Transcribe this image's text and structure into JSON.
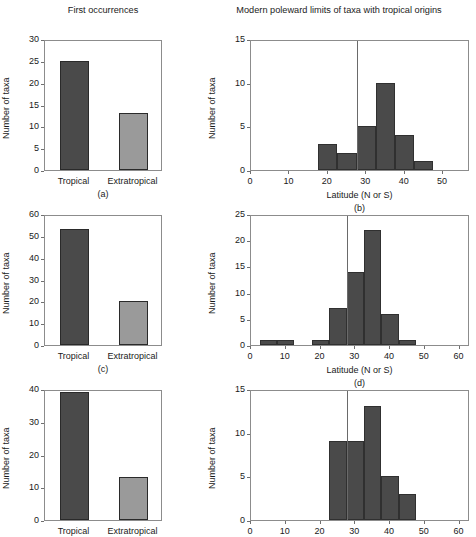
{
  "titles": {
    "left": "First occurrences",
    "right": "Modern poleward limits of taxa with tropical origins"
  },
  "axis_labels": {
    "y": "Number of taxa",
    "x_latitude": "Latitude (N or S)"
  },
  "region_labels": {
    "tropics": "Tropics",
    "extratropics": "Extratropics"
  },
  "categories": {
    "tropical": "Tropical",
    "extratropical": "Extratropical"
  },
  "colors": {
    "bar_dark": "#4a4a4a",
    "bar_light": "#9a9a9a",
    "axis": "#8c8c8c",
    "divider": "#6a6a6a",
    "text": "#1a1a1a"
  },
  "panel_letters": {
    "a": "(a)",
    "b": "(b)",
    "c": "(c)",
    "d": "(d)",
    "e": "(e)",
    "f": "(f)"
  },
  "n_labels": {
    "a": "N = 38",
    "b": "N = 25",
    "c": "N = 73",
    "d": "N = 53",
    "e": "N = 52",
    "f": "N = 39"
  },
  "chart_data": [
    {
      "id": "a",
      "type": "bar",
      "panel": "(a)",
      "title": "First occurrences",
      "categories": [
        "Tropical",
        "Extratropical"
      ],
      "values": [
        25,
        13
      ],
      "bar_colors": [
        "#4a4a4a",
        "#9a9a9a"
      ],
      "xlabel": "",
      "ylabel": "Number of taxa",
      "ylim": [
        0,
        30
      ],
      "yticks": [
        0,
        5,
        10,
        15,
        20,
        25,
        30
      ],
      "annotation": "N = 38",
      "n": 38,
      "grid": false,
      "legend": "none"
    },
    {
      "id": "b",
      "type": "bar",
      "panel": "(b)",
      "title": "Modern poleward limits of taxa with tropical origins",
      "histogram": true,
      "bin_edges": [
        17.5,
        22.5,
        27.5,
        32.5,
        37.5,
        42.5,
        47.5
      ],
      "values": [
        3,
        2,
        5,
        10,
        4,
        1
      ],
      "bar_color": "#4a4a4a",
      "xlabel": "Latitude (N or S)",
      "ylabel": "Number of taxa",
      "xlim": [
        0,
        57
      ],
      "xticks": [
        0,
        10,
        20,
        30,
        40,
        50
      ],
      "ylim": [
        0,
        15
      ],
      "yticks": [
        0,
        5,
        10,
        15
      ],
      "divider_x": 27.5,
      "region_left": "Tropics",
      "region_right": "Extratropics",
      "annotation": "N = 25",
      "n": 25,
      "grid": false,
      "legend": "none"
    },
    {
      "id": "c",
      "type": "bar",
      "panel": "(c)",
      "categories": [
        "Tropical",
        "Extratropical"
      ],
      "values": [
        53,
        20
      ],
      "bar_colors": [
        "#4a4a4a",
        "#9a9a9a"
      ],
      "xlabel": "",
      "ylabel": "Number of taxa",
      "ylim": [
        0,
        60
      ],
      "yticks": [
        0,
        10,
        20,
        30,
        40,
        50,
        60
      ],
      "annotation": "N = 73",
      "n": 73,
      "grid": false,
      "legend": "none"
    },
    {
      "id": "d",
      "type": "bar",
      "panel": "(d)",
      "histogram": true,
      "bin_edges": [
        2.5,
        7.5,
        12.5,
        17.5,
        22.5,
        27.5,
        32.5,
        37.5,
        42.5,
        47.5
      ],
      "values": [
        1,
        1,
        0,
        1,
        7,
        14,
        22,
        6,
        1
      ],
      "bar_color": "#4a4a4a",
      "xlabel": "Latitude (N or S)",
      "ylabel": "Number of taxa",
      "xlim": [
        0,
        63
      ],
      "xticks": [
        0,
        10,
        20,
        30,
        40,
        50,
        60
      ],
      "ylim": [
        0,
        25
      ],
      "yticks": [
        0,
        5,
        10,
        15,
        20,
        25
      ],
      "divider_x": 27.5,
      "region_left": "Tropics",
      "region_right": "Extratropics",
      "annotation": "N = 53",
      "n": 53,
      "grid": false,
      "legend": "none"
    },
    {
      "id": "e",
      "type": "bar",
      "panel": "(e)",
      "categories": [
        "Tropical",
        "Extratropical"
      ],
      "values": [
        39,
        13
      ],
      "bar_colors": [
        "#4a4a4a",
        "#9a9a9a"
      ],
      "xlabel": "",
      "ylabel": "Number of taxa",
      "ylim": [
        0,
        40
      ],
      "yticks": [
        0,
        10,
        20,
        30,
        40
      ],
      "annotation": "N = 52",
      "n": 52,
      "grid": false,
      "legend": "none"
    },
    {
      "id": "f",
      "type": "bar",
      "panel": "(f)",
      "histogram": true,
      "bin_edges": [
        22.5,
        27.5,
        32.5,
        37.5,
        42.5,
        47.5
      ],
      "values": [
        9,
        9,
        13,
        5,
        3
      ],
      "bar_color": "#4a4a4a",
      "xlabel": "Latitude (N or S)",
      "ylabel": "Number of taxa",
      "xlim": [
        0,
        63
      ],
      "xticks": [
        0,
        10,
        20,
        30,
        40,
        50,
        60
      ],
      "ylim": [
        0,
        15
      ],
      "yticks": [
        0,
        5,
        10,
        15
      ],
      "divider_x": 27.5,
      "region_left": "Tropics",
      "region_right": "Extratropics",
      "annotation": "N = 39",
      "n": 39,
      "grid": false,
      "legend": "none"
    }
  ]
}
